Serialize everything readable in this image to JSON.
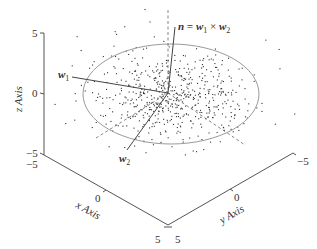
{
  "chart_data": {
    "type": "scatter",
    "subtype": "3d-scatter",
    "title": "",
    "xlabel": "x Axis",
    "ylabel": "y Axis",
    "zlabel": "z Axis",
    "xlim": [
      -5,
      5
    ],
    "ylim": [
      -5,
      5
    ],
    "zlim": [
      -5,
      5
    ],
    "x_ticks": [
      "-5",
      "0",
      "5"
    ],
    "y_ticks": [
      "5",
      "0",
      "-5"
    ],
    "z_ticks": [
      "5",
      "0",
      "-5"
    ],
    "grid": false,
    "annotations": [
      {
        "text": "w1",
        "label": "w",
        "sub": "1"
      },
      {
        "text": "w2",
        "label": "w",
        "sub": "2"
      },
      {
        "text": "n = w1 × w2",
        "parts": [
          "n",
          " = ",
          "w",
          "1",
          " × ",
          "w",
          "2"
        ]
      }
    ],
    "elements": {
      "scatter": {
        "n_points": 600,
        "distribution": "planar gaussian cloud, centered at origin"
      },
      "ellipse": {
        "description": "fitted plane boundary",
        "center": [
          0,
          0,
          0
        ]
      },
      "vectors": [
        "w1",
        "w2",
        "n"
      ],
      "dashed_axes": [
        "vertical",
        "diagonal"
      ]
    }
  },
  "labels": {
    "z_axis": "z Axis",
    "x_axis": "x Axis",
    "y_axis": "y Axis",
    "z_top": "5",
    "z_mid": "0",
    "z_bot": "−5",
    "x_start": "−5",
    "x_mid": "0",
    "x_end": "5",
    "y_start": "5",
    "y_mid": "0",
    "y_end": "−5",
    "w1_main": "w",
    "w1_sub": "1",
    "w2_main": "w",
    "w2_sub": "2",
    "n_eq": "n = ",
    "n_w1": "w",
    "n_w1_sub": "1",
    "n_times": " × ",
    "n_w2": "w",
    "n_w2_sub": "2"
  },
  "colors": {
    "axis": "#555555",
    "ellipse": "#9a9a9a",
    "points": "#333333",
    "vector": "#444444",
    "dashed": "#666666"
  }
}
